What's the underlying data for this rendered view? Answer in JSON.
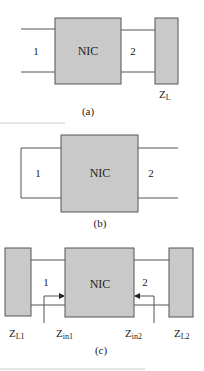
{
  "colors": {
    "box_fill": "#c9c9c9",
    "stroke": "#555555",
    "text": "#222222"
  },
  "diagram_a": {
    "nic_label": "NIC",
    "port1_label": "1",
    "port2_label": "2",
    "load_label_main": "Z",
    "load_label_sub": "L",
    "caption": "(a)"
  },
  "diagram_b": {
    "nic_label": "NIC",
    "port1_label": "1",
    "port2_label": "2",
    "caption": "(b)"
  },
  "diagram_c": {
    "nic_label": "NIC",
    "port1_label": "1",
    "port2_label": "2",
    "load1_main": "Z",
    "load1_sub": "L1",
    "zin1_main": "Z",
    "zin1_sub": "in1",
    "zin2_main": "Z",
    "zin2_sub": "in2",
    "load2_main": "Z",
    "load2_sub": "L2",
    "caption": "(c)"
  }
}
